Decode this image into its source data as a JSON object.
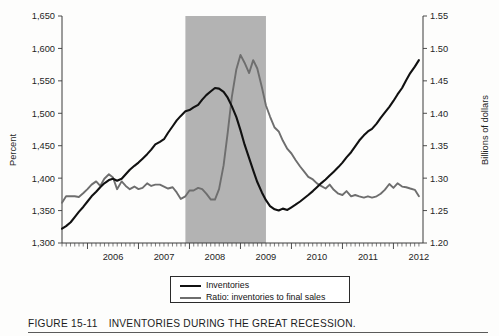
{
  "figure": {
    "number": "FIGURE 15-11",
    "caption": "INVENTORIES DURING THE GREAT RECESSION."
  },
  "legend": {
    "items": [
      {
        "label": "Inventories",
        "color": "#111111",
        "axis": "left"
      },
      {
        "label": "Ratio: inventories to final sales",
        "color": "#6e6e6e",
        "axis": "right"
      }
    ]
  },
  "axes": {
    "left": {
      "title": "Percent",
      "ticks": [
        "1,300",
        "1,350",
        "1,400",
        "1,450",
        "1,500",
        "1,550",
        "1,600",
        "1,650"
      ]
    },
    "right": {
      "title": "Billions of dollars",
      "ticks": [
        "1.20",
        "1.25",
        "1.30",
        "1.35",
        "1.40",
        "1.45",
        "1.50",
        "1.55"
      ]
    },
    "bottom": {
      "ticks": [
        "2006",
        "2007",
        "2008",
        "2009",
        "2010",
        "2011",
        "2012"
      ]
    }
  },
  "chart_data": {
    "type": "line",
    "title": "INVENTORIES DURING THE GREAT RECESSION.",
    "xlabel": "",
    "ylabel": "Percent",
    "y2label": "Billions of dollars",
    "xlim": [
      2005.5,
      2012.58
    ],
    "ylim": [
      1300,
      1650
    ],
    "y2lim": [
      1.2,
      1.55
    ],
    "ytick_step": 50,
    "y2tick_step": 0.05,
    "grid": false,
    "legend_position": "bottom-center",
    "annotations": [
      {
        "type": "shaded-band",
        "label": "Great Recession (NBER)",
        "x_start": 2007.92,
        "x_end": 2009.5,
        "color": "#b3b3b3"
      }
    ],
    "x": [
      2005.5,
      2005.58,
      2005.67,
      2005.75,
      2005.83,
      2005.92,
      2006.0,
      2006.08,
      2006.17,
      2006.25,
      2006.33,
      2006.42,
      2006.5,
      2006.58,
      2006.67,
      2006.75,
      2006.83,
      2006.92,
      2007.0,
      2007.08,
      2007.17,
      2007.25,
      2007.33,
      2007.42,
      2007.5,
      2007.58,
      2007.67,
      2007.75,
      2007.83,
      2007.92,
      2008.0,
      2008.08,
      2008.17,
      2008.25,
      2008.33,
      2008.42,
      2008.5,
      2008.58,
      2008.67,
      2008.75,
      2008.83,
      2008.92,
      2009.0,
      2009.08,
      2009.17,
      2009.25,
      2009.33,
      2009.42,
      2009.5,
      2009.58,
      2009.67,
      2009.75,
      2009.83,
      2009.92,
      2010.0,
      2010.08,
      2010.17,
      2010.25,
      2010.33,
      2010.42,
      2010.5,
      2010.58,
      2010.67,
      2010.75,
      2010.83,
      2010.92,
      2011.0,
      2011.08,
      2011.17,
      2011.25,
      2011.33,
      2011.42,
      2011.5,
      2011.58,
      2011.67,
      2011.75,
      2011.83,
      2011.92,
      2012.0,
      2012.08,
      2012.17,
      2012.25,
      2012.33,
      2012.42,
      2012.5
    ],
    "series": [
      {
        "name": "Inventories",
        "axis": "left",
        "units": "billions of dollars (mislabeled Percent)",
        "color": "#111111",
        "values": [
          1322,
          1326,
          1332,
          1340,
          1348,
          1356,
          1364,
          1372,
          1379,
          1386,
          1392,
          1397,
          1399,
          1396,
          1399,
          1406,
          1413,
          1419,
          1424,
          1430,
          1437,
          1444,
          1452,
          1456,
          1460,
          1470,
          1480,
          1489,
          1496,
          1503,
          1505,
          1509,
          1513,
          1521,
          1528,
          1534,
          1539,
          1538,
          1533,
          1524,
          1511,
          1494,
          1474,
          1452,
          1431,
          1412,
          1394,
          1378,
          1366,
          1357,
          1352,
          1350,
          1353,
          1351,
          1355,
          1359,
          1364,
          1369,
          1374,
          1380,
          1386,
          1392,
          1398,
          1404,
          1410,
          1417,
          1424,
          1432,
          1440,
          1449,
          1458,
          1466,
          1472,
          1476,
          1484,
          1493,
          1501,
          1510,
          1519,
          1529,
          1539,
          1551,
          1562,
          1572,
          1582
        ]
      },
      {
        "name": "Ratio: inventories to final sales",
        "axis": "right",
        "units": "ratio",
        "color": "#6e6e6e",
        "values": [
          1.262,
          1.272,
          1.272,
          1.272,
          1.271,
          1.277,
          1.283,
          1.29,
          1.295,
          1.288,
          1.299,
          1.306,
          1.301,
          1.283,
          1.295,
          1.288,
          1.283,
          1.287,
          1.283,
          1.285,
          1.292,
          1.288,
          1.29,
          1.29,
          1.287,
          1.284,
          1.286,
          1.278,
          1.268,
          1.272,
          1.281,
          1.281,
          1.285,
          1.283,
          1.276,
          1.267,
          1.267,
          1.283,
          1.32,
          1.37,
          1.425,
          1.468,
          1.49,
          1.478,
          1.462,
          1.482,
          1.469,
          1.44,
          1.412,
          1.395,
          1.378,
          1.372,
          1.358,
          1.345,
          1.338,
          1.328,
          1.318,
          1.31,
          1.302,
          1.298,
          1.292,
          1.288,
          1.284,
          1.29,
          1.282,
          1.276,
          1.274,
          1.28,
          1.272,
          1.274,
          1.272,
          1.27,
          1.272,
          1.27,
          1.272,
          1.276,
          1.282,
          1.291,
          1.285,
          1.292,
          1.287,
          1.286,
          1.284,
          1.282,
          1.272
        ]
      }
    ]
  }
}
